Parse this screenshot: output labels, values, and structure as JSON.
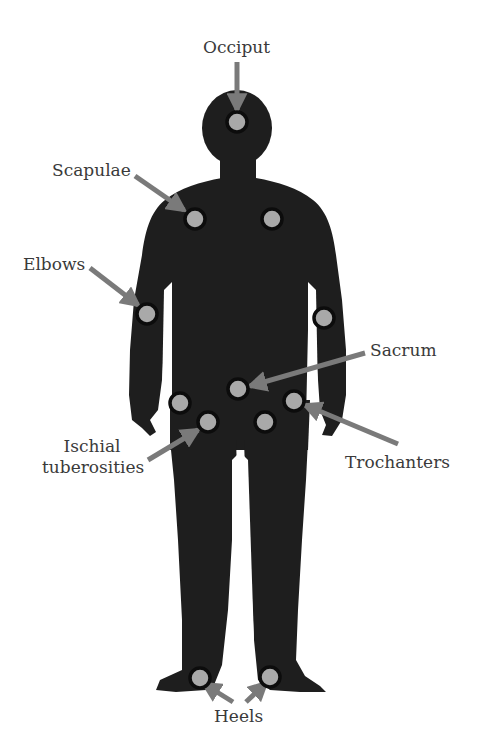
{
  "figure": {
    "colors": {
      "silhouette": "#1e1e1e",
      "dot_fill": "#a9a9a9",
      "dot_ring": "#0c0c0c",
      "arrow": "#7a7a7a",
      "label_text": "#3a3a3a",
      "background": "#ffffff"
    },
    "labels": {
      "occiput": "Occiput",
      "scapulae": "Scapulae",
      "elbows": "Elbows",
      "sacrum": "Sacrum",
      "ischial_line1": "Ischial",
      "ischial_line2": "tuberosities",
      "trochanters": "Trochanters",
      "heels": "Heels"
    },
    "points": [
      {
        "name": "Occiput",
        "x": 237,
        "y": 122
      },
      {
        "name": "Scapulae",
        "x": 195,
        "y": 219
      },
      {
        "name": "Scapulae",
        "x": 272,
        "y": 219
      },
      {
        "name": "Elbows",
        "x": 147,
        "y": 314
      },
      {
        "name": "Elbows",
        "x": 324,
        "y": 318
      },
      {
        "name": "Sacrum",
        "x": 238,
        "y": 389
      },
      {
        "name": "Trochanters",
        "x": 180,
        "y": 403
      },
      {
        "name": "Trochanters",
        "x": 294,
        "y": 401
      },
      {
        "name": "Ischial tuberosities",
        "x": 208,
        "y": 422
      },
      {
        "name": "Ischial tuberosities",
        "x": 265,
        "y": 422
      },
      {
        "name": "Heels",
        "x": 200,
        "y": 678
      },
      {
        "name": "Heels",
        "x": 270,
        "y": 677
      }
    ]
  }
}
